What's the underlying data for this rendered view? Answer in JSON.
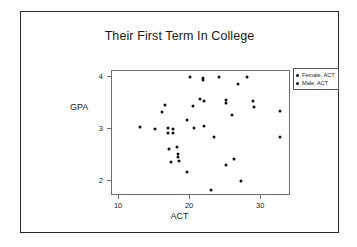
{
  "chart_data": {
    "type": "scatter",
    "title": "Their First Term In College",
    "xlabel": "ACT",
    "ylabel": "GPA",
    "xlim": [
      9,
      34.2
    ],
    "ylim": [
      1.72,
      4.12
    ],
    "xticks": [
      10,
      20,
      30
    ],
    "xtick_labels": [
      "10",
      "20",
      "30"
    ],
    "yticks": [
      2,
      3,
      4
    ],
    "ytick_labels": [
      "2",
      "3",
      "4"
    ],
    "grid": false,
    "legend_position": "outside-right-top",
    "series": [
      {
        "name": "Female, ACT",
        "marker": "dot",
        "color": "#101010",
        "points": [
          [
            13.0,
            3.05
          ],
          [
            15.0,
            3.01
          ],
          [
            16.1,
            3.34
          ],
          [
            16.5,
            3.46
          ],
          [
            16.9,
            3.02
          ],
          [
            16.9,
            2.93
          ],
          [
            17.0,
            2.62
          ],
          [
            17.3,
            2.38
          ],
          [
            17.6,
            3.01
          ],
          [
            17.6,
            2.93
          ],
          [
            18.2,
            2.66
          ],
          [
            18.3,
            2.52
          ],
          [
            18.3,
            2.46
          ],
          [
            18.4,
            2.4
          ],
          [
            19.5,
            3.17
          ],
          [
            19.6,
            2.19
          ],
          [
            20.0,
            4.0
          ],
          [
            20.4,
            3.44
          ],
          [
            20.5,
            3.02
          ],
          [
            21.4,
            3.58
          ],
          [
            21.8,
            3.99
          ],
          [
            21.8,
            3.94
          ],
          [
            22.0,
            3.07
          ]
        ]
      },
      {
        "name": "Male, ACT",
        "marker": "dot",
        "color": "#101010",
        "points": [
          [
            21.9,
            3.55
          ],
          [
            23.0,
            1.83
          ],
          [
            23.3,
            2.86
          ],
          [
            24.0,
            4.0
          ],
          [
            25.0,
            3.56
          ],
          [
            25.0,
            3.5
          ],
          [
            25.1,
            2.31
          ],
          [
            25.9,
            3.28
          ],
          [
            26.2,
            2.43
          ],
          [
            26.8,
            3.88
          ],
          [
            27.1,
            2.01
          ],
          [
            28.0,
            4.0
          ],
          [
            28.9,
            3.54
          ],
          [
            29.0,
            3.42
          ],
          [
            32.6,
            3.35
          ],
          [
            32.6,
            2.86
          ]
        ]
      }
    ]
  },
  "legend": {
    "items": [
      {
        "label": "Female, ACT"
      },
      {
        "label": "Male, ACT"
      }
    ]
  }
}
